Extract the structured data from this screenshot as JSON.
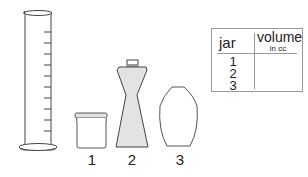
{
  "figure": {
    "cylinder": {
      "name": "graduated-cylinder",
      "tick_count": 10
    },
    "containers": [
      {
        "id": "1",
        "label": "1",
        "shape": "jar",
        "fill": "#ffffff"
      },
      {
        "id": "2",
        "label": "2",
        "shape": "bottle",
        "fill": "#e3e3e3"
      },
      {
        "id": "3",
        "label": "3",
        "shape": "vase",
        "fill": "#ffffff"
      }
    ],
    "stroke_color": "#444444"
  },
  "table": {
    "headers": {
      "jar": "jar",
      "volume": "volume",
      "volume_unit": "in cc"
    },
    "rows": [
      {
        "jar": "1",
        "volume": ""
      },
      {
        "jar": "2",
        "volume": ""
      },
      {
        "jar": "3",
        "volume": ""
      }
    ]
  }
}
